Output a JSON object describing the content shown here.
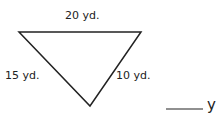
{
  "diagram": {
    "shape": "triangle",
    "orientation": "inverted",
    "stroke_color": "#222222",
    "sides": [
      {
        "name": "top",
        "label": "20 yd."
      },
      {
        "name": "left",
        "label": "15 yd."
      },
      {
        "name": "right",
        "label": "10 yd."
      }
    ]
  },
  "answer": {
    "blank": "____",
    "unit_partial": "y"
  }
}
